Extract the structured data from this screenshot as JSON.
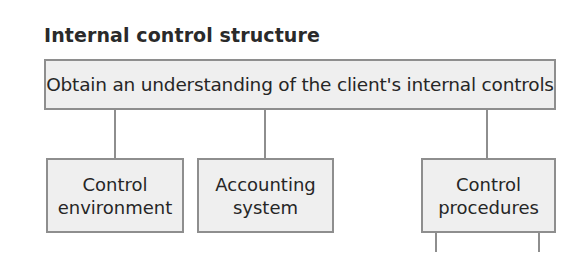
{
  "diagram": {
    "title": "Internal control structure",
    "root": {
      "label": "Obtain an understanding of the client's internal controls"
    },
    "children": [
      {
        "line1": "Control",
        "line2": "environment"
      },
      {
        "line1": "Accounting",
        "line2": "system"
      },
      {
        "line1": "Control",
        "line2": "procedures"
      }
    ],
    "colors": {
      "box_fill": "#efefef",
      "box_border": "#8e8e8e",
      "connector": "#8e8e8e",
      "text": "#262626"
    }
  }
}
